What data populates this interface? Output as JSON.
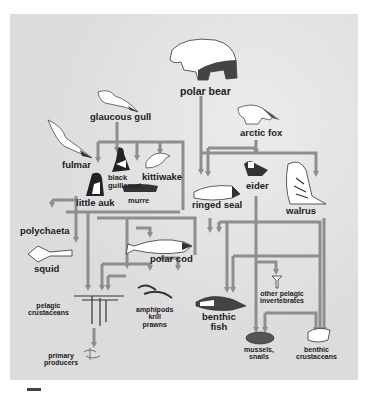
{
  "diagram": {
    "type": "arctic food web",
    "colors": {
      "panel_bg": "#dcdcdc",
      "arrow": "#8e8e8e",
      "text": "#222222"
    },
    "nodes": {
      "polar_bear": "polar bear",
      "glaucous_gull": "glaucous gull",
      "arctic_fox": "arctic fox",
      "fulmar": "fulmar",
      "black_guillemot": "black guillemot",
      "kittiwake": "kittiwake",
      "eider": "eider",
      "little_auk": "little auk",
      "murre": "murre",
      "ringed_seal": "ringed seal",
      "walrus": "walrus",
      "polychaeta": "polychaeta",
      "squid": "squid",
      "polar_cod": "polar cod",
      "pelagic_crustaceans": "pelagic crustaceans",
      "amphipods": "amphipods krill prawns",
      "other_pelagic_invertebrates": "other pelagic invertebrates",
      "benthic_fish": "benthic fish",
      "primary_producers": "primary producers",
      "mussels_snails": "mussels, snails",
      "benthic_crustaceans": "benthic crustaceans"
    },
    "labels": {
      "polar_bear": "polar bear",
      "glaucous_gull": "glaucous gull",
      "arctic_fox": "arctic fox",
      "fulmar": "fulmar",
      "black_guillemot_1": "black",
      "black_guillemot_2": "guillemot",
      "kittiwake": "kittiwake",
      "eider": "eider",
      "little_auk": "little auk",
      "murre": "murre",
      "ringed_seal": "ringed seal",
      "walrus": "walrus",
      "polychaeta": "polychaeta",
      "squid": "squid",
      "polar_cod": "polar cod",
      "pelagic_crustaceans_1": "pelagic",
      "pelagic_crustaceans_2": "crustaceans",
      "amphipods_1": "amphipods",
      "amphipods_2": "krill",
      "amphipods_3": "prawns",
      "other_pelagic_1": "other pelagic",
      "other_pelagic_2": "invertebrates",
      "benthic_fish_1": "benthic",
      "benthic_fish_2": "fish",
      "primary_producers_1": "primary",
      "primary_producers_2": "producers",
      "mussels_1": "mussels,",
      "mussels_2": "snails",
      "benthic_crustaceans_1": "benthic",
      "benthic_crustaceans_2": "crustaceans"
    },
    "edges": [
      [
        "glaucous gull",
        "black guillemot"
      ],
      [
        "glaucous gull",
        "kittiwake"
      ],
      [
        "glaucous gull",
        "little auk"
      ],
      [
        "glaucous gull",
        "murre"
      ],
      [
        "glaucous gull",
        "eider"
      ],
      [
        "polar bear",
        "ringed seal"
      ],
      [
        "arctic fox",
        "ringed seal"
      ],
      [
        "arctic fox",
        "eider"
      ],
      [
        "arctic fox",
        "walrus"
      ],
      [
        "fulmar",
        "squid"
      ],
      [
        "fulmar",
        "polychaeta"
      ],
      [
        "little auk",
        "pelagic crustaceans"
      ],
      [
        "murre",
        "polar cod"
      ],
      [
        "black guillemot",
        "polar cod"
      ],
      [
        "kittiwake",
        "polar cod"
      ],
      [
        "ringed seal",
        "polar cod"
      ],
      [
        "ringed seal",
        "benthic fish"
      ],
      [
        "walrus",
        "mussels, snails"
      ],
      [
        "walrus",
        "benthic crustaceans"
      ],
      [
        "eider",
        "mussels, snails"
      ],
      [
        "polar cod",
        "pelagic crustaceans"
      ],
      [
        "polar cod",
        "amphipods krill prawns"
      ],
      [
        "benthic fish",
        "other pelagic invertebrates"
      ],
      [
        "benthic fish",
        "benthic crustaceans"
      ],
      [
        "pelagic crustaceans",
        "primary producers"
      ]
    ]
  }
}
